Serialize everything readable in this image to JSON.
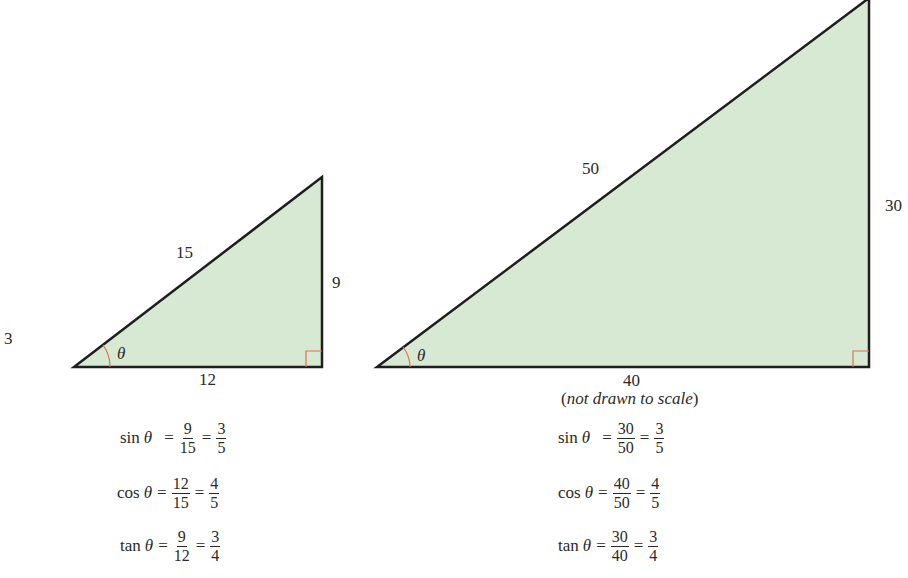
{
  "colors": {
    "fill": "#d7e8d3",
    "stroke": "#1e1e1e",
    "angle_mark": "#e07050"
  },
  "stray_label": "3",
  "small_triangle": {
    "hypotenuse": "15",
    "opposite": "9",
    "adjacent": "12",
    "angle": "θ",
    "equations": [
      {
        "fn": "sin",
        "var": "θ",
        "num1": "9",
        "den1": "15",
        "num2": "3",
        "den2": "5"
      },
      {
        "fn": "cos",
        "var": "θ",
        "num1": "12",
        "den1": "15",
        "num2": "4",
        "den2": "5"
      },
      {
        "fn": "tan",
        "var": "θ",
        "num1": "9",
        "den1": "12",
        "num2": "3",
        "den2": "4"
      }
    ]
  },
  "large_triangle": {
    "hypotenuse": "50",
    "opposite": "30",
    "adjacent": "40",
    "angle": "θ",
    "note_open": "(",
    "note": "not drawn to scale",
    "note_close": ")",
    "equations": [
      {
        "fn": "sin",
        "var": "θ",
        "num1": "30",
        "den1": "50",
        "num2": "3",
        "den2": "5"
      },
      {
        "fn": "cos",
        "var": "θ",
        "num1": "40",
        "den1": "50",
        "num2": "4",
        "den2": "5"
      },
      {
        "fn": "tan",
        "var": "θ",
        "num1": "30",
        "den1": "40",
        "num2": "3",
        "den2": "4"
      }
    ]
  },
  "ops": {
    "eq": "="
  }
}
